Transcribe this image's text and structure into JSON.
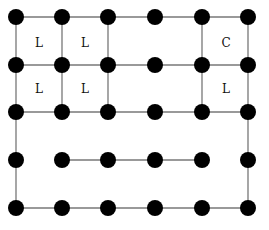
{
  "diagram": {
    "columns_x": [
      16,
      62,
      108,
      155,
      202,
      248
    ],
    "rows_y": [
      17,
      65,
      112,
      160,
      208
    ],
    "dot_radius": 8,
    "dot_color": "#000000",
    "line_color": "#777777",
    "edges": [
      [
        [
          0,
          0
        ],
        [
          5,
          0
        ]
      ],
      [
        [
          0,
          1
        ],
        [
          5,
          1
        ]
      ],
      [
        [
          0,
          2
        ],
        [
          5,
          2
        ]
      ],
      [
        [
          1,
          3
        ],
        [
          4,
          3
        ]
      ],
      [
        [
          0,
          4
        ],
        [
          5,
          4
        ]
      ],
      [
        [
          0,
          0
        ],
        [
          0,
          4
        ]
      ],
      [
        [
          5,
          0
        ],
        [
          5,
          4
        ]
      ],
      [
        [
          1,
          0
        ],
        [
          1,
          2
        ]
      ],
      [
        [
          2,
          0
        ],
        [
          2,
          2
        ]
      ],
      [
        [
          4,
          0
        ],
        [
          4,
          2
        ]
      ]
    ],
    "cell_labels": [
      {
        "text": "L",
        "x": 39,
        "y": 43
      },
      {
        "text": "L",
        "x": 85,
        "y": 43
      },
      {
        "text": "C",
        "x": 226,
        "y": 43
      },
      {
        "text": "L",
        "x": 39,
        "y": 89
      },
      {
        "text": "L",
        "x": 85,
        "y": 89
      },
      {
        "text": "L",
        "x": 226,
        "y": 89
      }
    ]
  }
}
